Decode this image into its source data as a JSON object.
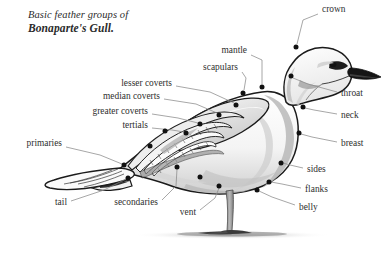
{
  "title": {
    "line1": "Basic feather groups of",
    "line2": "Bonaparte's Gull."
  },
  "colors": {
    "ink": "#1b1b1b",
    "text": "#2f2f2f",
    "leader": "#8a8a8a",
    "shade_light": "#e8e8e8",
    "shade_mid": "#c9c9c9",
    "shade_dark": "#9b9b9b",
    "ground": "#b3b3b3",
    "marker": "#111111",
    "background": "#ffffff"
  },
  "labels": [
    {
      "name": "crown",
      "text": "crown",
      "side": "right",
      "x": 322,
      "y": 10,
      "anchor_x": 296,
      "anchor_y": 47,
      "leader": [
        [
          318,
          14
        ],
        [
          303,
          20
        ],
        [
          297,
          44
        ]
      ]
    },
    {
      "name": "mantle",
      "text": "mantle",
      "side": "left",
      "x": 247,
      "y": 51,
      "anchor_x": 262,
      "anchor_y": 87,
      "leader": [
        [
          251,
          55
        ],
        [
          262,
          60
        ],
        [
          262,
          84
        ]
      ]
    },
    {
      "name": "scapulars",
      "text": "scapulars",
      "side": "left",
      "x": 238,
      "y": 68,
      "anchor_x": 243,
      "anchor_y": 93,
      "leader": [
        [
          242,
          72
        ],
        [
          246,
          78
        ],
        [
          244,
          90
        ]
      ]
    },
    {
      "name": "lesser-coverts",
      "text": "lesser coverts",
      "side": "left",
      "x": 172,
      "y": 84,
      "anchor_x": 236,
      "anchor_y": 105,
      "leader": [
        [
          176,
          86
        ],
        [
          210,
          92
        ],
        [
          234,
          103
        ]
      ]
    },
    {
      "name": "median-coverts",
      "text": "median coverts",
      "side": "left",
      "x": 160,
      "y": 97,
      "anchor_x": 219,
      "anchor_y": 115,
      "leader": [
        [
          164,
          99
        ],
        [
          196,
          104
        ],
        [
          217,
          113
        ]
      ]
    },
    {
      "name": "greater-coverts",
      "text": "greater coverts",
      "side": "left",
      "x": 148,
      "y": 112,
      "anchor_x": 200,
      "anchor_y": 124,
      "leader": [
        [
          152,
          114
        ],
        [
          178,
          118
        ],
        [
          198,
          123
        ]
      ]
    },
    {
      "name": "tertials",
      "text": "tertials",
      "side": "left",
      "x": 148,
      "y": 126,
      "anchor_x": 186,
      "anchor_y": 133,
      "leader": [
        [
          152,
          128
        ],
        [
          172,
          130
        ],
        [
          184,
          132
        ]
      ]
    },
    {
      "name": "primaries",
      "text": "primaries",
      "side": "left",
      "x": 62,
      "y": 144,
      "anchor_x": 124,
      "anchor_y": 165,
      "leader": [
        [
          66,
          147
        ],
        [
          100,
          155
        ],
        [
          122,
          164
        ]
      ]
    },
    {
      "name": "tail",
      "text": "tail",
      "side": "left",
      "x": 67,
      "y": 203,
      "anchor_x": 128,
      "anchor_y": 178,
      "leader": [
        [
          71,
          201
        ],
        [
          104,
          190
        ],
        [
          126,
          179
        ]
      ]
    },
    {
      "name": "secondaries",
      "text": "secondaries",
      "side": "left",
      "x": 158,
      "y": 203,
      "anchor_x": 177,
      "anchor_y": 167,
      "leader": [
        [
          162,
          200
        ],
        [
          176,
          186
        ],
        [
          177,
          169
        ]
      ]
    },
    {
      "name": "vent",
      "text": "vent",
      "side": "left",
      "x": 196,
      "y": 213,
      "anchor_x": 219,
      "anchor_y": 186,
      "leader": [
        [
          200,
          210
        ],
        [
          215,
          198
        ],
        [
          219,
          188
        ]
      ]
    },
    {
      "name": "belly",
      "text": "belly",
      "side": "right",
      "x": 299,
      "y": 208,
      "anchor_x": 257,
      "anchor_y": 190,
      "leader": [
        [
          295,
          205
        ],
        [
          272,
          197
        ],
        [
          259,
          191
        ]
      ]
    },
    {
      "name": "flanks",
      "text": "flanks",
      "side": "right",
      "x": 305,
      "y": 190,
      "anchor_x": 269,
      "anchor_y": 182,
      "leader": [
        [
          301,
          188
        ],
        [
          282,
          184
        ],
        [
          271,
          182
        ]
      ]
    },
    {
      "name": "sides",
      "text": "sides",
      "side": "right",
      "x": 307,
      "y": 170,
      "anchor_x": 281,
      "anchor_y": 163,
      "leader": [
        [
          303,
          168
        ],
        [
          290,
          165
        ],
        [
          283,
          163
        ]
      ]
    },
    {
      "name": "breast",
      "text": "breast",
      "side": "right",
      "x": 341,
      "y": 144,
      "anchor_x": 299,
      "anchor_y": 133,
      "leader": [
        [
          337,
          142
        ],
        [
          312,
          137
        ],
        [
          301,
          134
        ]
      ]
    },
    {
      "name": "neck",
      "text": "neck",
      "side": "right",
      "x": 341,
      "y": 116,
      "anchor_x": 303,
      "anchor_y": 107,
      "leader": [
        [
          337,
          114
        ],
        [
          314,
          110
        ],
        [
          305,
          108
        ]
      ]
    },
    {
      "name": "throat",
      "text": "throat",
      "side": "right",
      "x": 341,
      "y": 94,
      "anchor_x": 291,
      "anchor_y": 76,
      "leader": [
        [
          337,
          92
        ],
        [
          308,
          84
        ],
        [
          293,
          78
        ]
      ]
    },
    {
      "name": "sides-upper",
      "text": "sides",
      "side": "right",
      "x": 307,
      "y": 170,
      "anchor_x": 281,
      "anchor_y": 163,
      "leader": []
    }
  ],
  "markers": [
    {
      "name": "marker-crown",
      "x": 296,
      "y": 47
    },
    {
      "name": "marker-throat",
      "x": 291,
      "y": 76
    },
    {
      "name": "marker-neck",
      "x": 303,
      "y": 107
    },
    {
      "name": "marker-breast",
      "x": 299,
      "y": 133
    },
    {
      "name": "marker-sides",
      "x": 281,
      "y": 163
    },
    {
      "name": "marker-flanks",
      "x": 269,
      "y": 182
    },
    {
      "name": "marker-belly",
      "x": 257,
      "y": 190
    },
    {
      "name": "marker-vent",
      "x": 219,
      "y": 186
    },
    {
      "name": "marker-mantle",
      "x": 262,
      "y": 87
    },
    {
      "name": "marker-scapulars",
      "x": 243,
      "y": 93
    },
    {
      "name": "marker-lesser",
      "x": 236,
      "y": 105
    },
    {
      "name": "marker-median",
      "x": 219,
      "y": 115
    },
    {
      "name": "marker-greater",
      "x": 200,
      "y": 124
    },
    {
      "name": "marker-tertials",
      "x": 186,
      "y": 133
    },
    {
      "name": "marker-secondaries",
      "x": 177,
      "y": 167
    },
    {
      "name": "marker-primaries",
      "x": 124,
      "y": 165
    },
    {
      "name": "marker-tail",
      "x": 128,
      "y": 178
    },
    {
      "name": "marker-wing-mid",
      "x": 165,
      "y": 131
    },
    {
      "name": "marker-wing-low",
      "x": 150,
      "y": 146
    },
    {
      "name": "marker-body-low",
      "x": 200,
      "y": 177
    }
  ],
  "ground": {
    "label": "ground-shadow",
    "x": 130,
    "y": 230,
    "width": 200,
    "height": 10
  }
}
